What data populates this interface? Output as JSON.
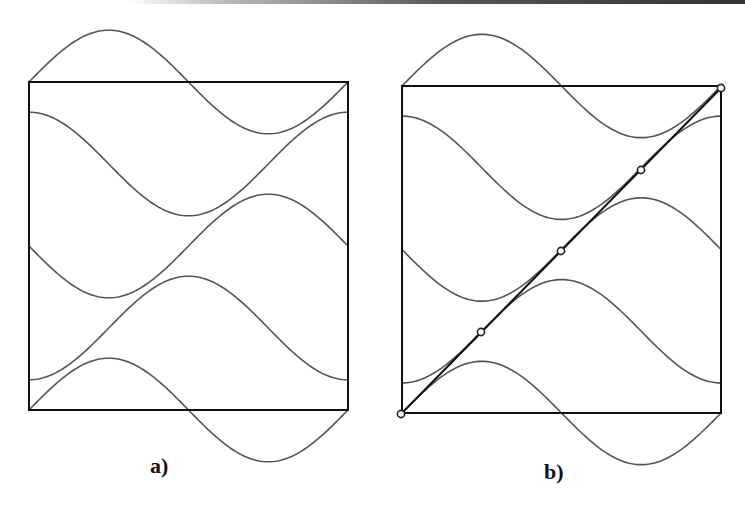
{
  "figure": {
    "panels": [
      {
        "id": "a",
        "label": "a)",
        "box": {
          "left": 29,
          "top": 82,
          "right": 348,
          "bottom": 410
        },
        "label_pos": {
          "x": 150,
          "y": 453
        },
        "diagonal": false,
        "markers": []
      },
      {
        "id": "b",
        "label": "b)",
        "box": {
          "left": 402,
          "top": 86,
          "right": 721,
          "bottom": 413
        },
        "label_pos": {
          "x": 544,
          "y": 459
        },
        "diagonal": true,
        "markers": [
          {
            "x": 401,
            "y": 414
          },
          {
            "x": 481,
            "y": 332
          },
          {
            "x": 561,
            "y": 251
          },
          {
            "x": 641,
            "y": 170
          },
          {
            "x": 721,
            "y": 88
          }
        ]
      }
    ],
    "curves": [
      {
        "name": "wave-1",
        "center_frac": 0.0,
        "amplitude_frac": 0.158,
        "phase": "neg-sin"
      },
      {
        "name": "wave-2",
        "center_frac": 0.25,
        "amplitude_frac": 0.158,
        "phase": "neg-cos"
      },
      {
        "name": "wave-3",
        "center_frac": 0.5,
        "amplitude_frac": 0.158,
        "phase": "sin"
      },
      {
        "name": "wave-4",
        "center_frac": 0.75,
        "amplitude_frac": 0.158,
        "phase": "cos"
      },
      {
        "name": "wave-5",
        "center_frac": 1.0,
        "amplitude_frac": 0.158,
        "phase": "neg-sin"
      }
    ],
    "colors": {
      "box": "#111111",
      "curve": "#555555",
      "marker_fill": "#ffffff",
      "marker_stroke": "#222222"
    }
  }
}
